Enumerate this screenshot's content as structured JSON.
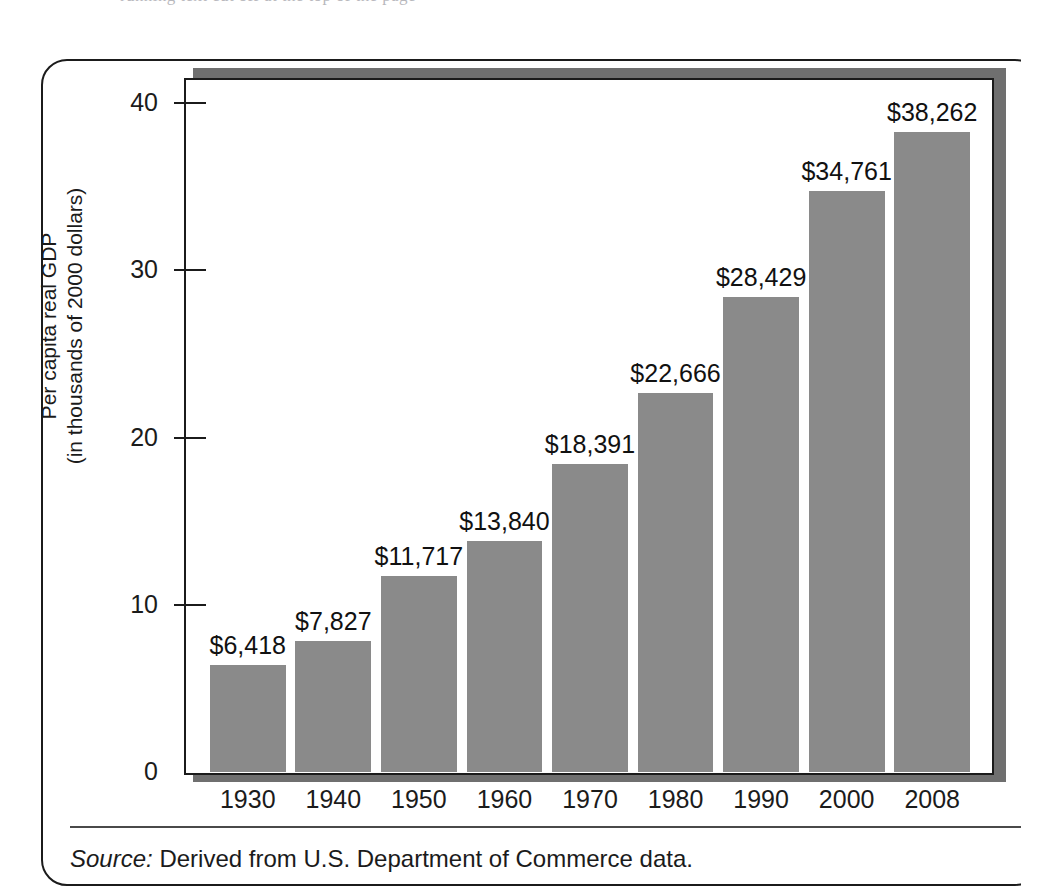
{
  "page": {
    "top_bleed_text": "running text cut off at the top of the page"
  },
  "figure": {
    "source_label": "Source:",
    "source_text": "Derived from U.S. Department of Commerce data."
  },
  "colors": {
    "bar_fill": "#8a8a8a",
    "frame": "#1b1b1b",
    "shadow": "#6f6f6f",
    "text": "#1b1b1b",
    "right_block": "#dcdcdc"
  },
  "chart_data": {
    "type": "bar",
    "title": "",
    "xlabel": "",
    "ylabel": "Per capita real GDP (in thousands of 2000 dollars)",
    "ylabel_lines": [
      "Per capita real GDP",
      "(in thousands of 2000 dollars)"
    ],
    "categories": [
      "1930",
      "1940",
      "1950",
      "1960",
      "1970",
      "1980",
      "1990",
      "2000",
      "2008"
    ],
    "values": [
      6.418,
      7.827,
      11.717,
      13.84,
      18.391,
      22.666,
      28.429,
      34.761,
      38.262
    ],
    "data_labels": [
      "$6,418",
      "$7,827",
      "$11,717",
      "$13,840",
      "$18,391",
      "$22,666",
      "$28,429",
      "$34,761",
      "$38,262"
    ],
    "ylim": [
      0,
      41.5
    ],
    "yticks": [
      0,
      10,
      20,
      30,
      40
    ],
    "ytick_labels": [
      "0",
      "10",
      "20",
      "30",
      "40"
    ],
    "grid": false,
    "legend": null,
    "units": "thousands of 2000 dollars"
  }
}
